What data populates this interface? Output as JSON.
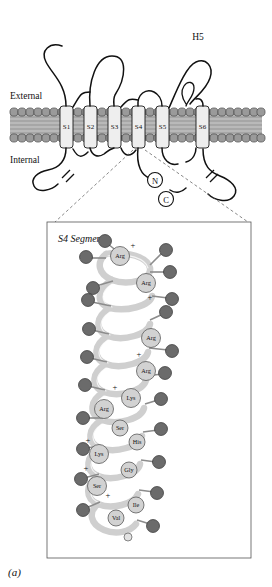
{
  "figure": {
    "caption": "(a)",
    "membrane": {
      "external_label": "External",
      "internal_label": "Internal",
      "h5_label": "H5",
      "n_terminus": "N",
      "c_terminus": "C",
      "segments": [
        "S1",
        "S2",
        "S3",
        "S4",
        "S5",
        "S6"
      ]
    },
    "inset": {
      "title": "S4 Segment",
      "residues": [
        {
          "name": "Arg",
          "shade": "light"
        },
        {
          "name": "Arg",
          "shade": "light"
        },
        {
          "name": "Arg",
          "shade": "light"
        },
        {
          "name": "Arg",
          "shade": "light"
        },
        {
          "name": "Lys",
          "shade": "light"
        },
        {
          "name": "Arg",
          "shade": "light"
        },
        {
          "name": "Lys",
          "shade": "light"
        },
        {
          "name": "Ser",
          "shade": "light"
        },
        {
          "name": "Ile",
          "shade": "light"
        },
        {
          "name": "His",
          "shade": "light"
        },
        {
          "name": "Gly",
          "shade": "light"
        },
        {
          "name": "Phe",
          "shade": "dark"
        },
        {
          "name": "Leu",
          "shade": "dark"
        },
        {
          "name": "Leu",
          "shade": "dark"
        },
        {
          "name": "Val",
          "shade": "dark"
        },
        {
          "name": "Ala",
          "shade": "dark"
        },
        {
          "name": "Leu",
          "shade": "dark"
        },
        {
          "name": "Ile",
          "shade": "dark"
        },
        {
          "name": "Val",
          "shade": "dark"
        },
        {
          "name": "Phe",
          "shade": "dark"
        },
        {
          "name": "Leu",
          "shade": "dark"
        },
        {
          "name": "Met",
          "shade": "dark"
        }
      ],
      "charge_signs": [
        "+",
        "+",
        "+",
        "+",
        "+",
        "+",
        "+"
      ]
    },
    "colors": {
      "membrane_lipid": "#9a9a9a",
      "helix_fill": "#e8e8e8",
      "outline": "#1a1a1a",
      "residue_light": "#cfcfcf",
      "residue_dark": "#6b6b6b",
      "backbone": "#d8d8d8"
    }
  }
}
